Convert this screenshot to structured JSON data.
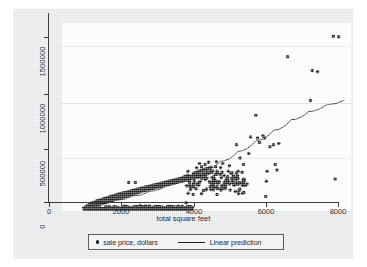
{
  "chart_data": {
    "type": "scatter",
    "title": "",
    "xlabel": "total square feet",
    "ylabel": "",
    "xlim": [
      0,
      8200
    ],
    "ylim": [
      0,
      1700000
    ],
    "xticks": [
      0,
      2000,
      4000,
      6000,
      8000
    ],
    "xtick_labels": [
      "0",
      "2000",
      "4000",
      "6000",
      "8000"
    ],
    "yticks": [
      0,
      500000,
      1000000,
      1500000
    ],
    "ytick_labels": [
      "0",
      "500000",
      "1000000",
      "1500000"
    ],
    "grid": "horizontal",
    "legend_position": "bottom",
    "legend": [
      {
        "label": "sale price, dollars",
        "marker": "dot",
        "color": "#1a1c1e"
      },
      {
        "label": "Linear prediction",
        "marker": "line",
        "color": "#1a1c1e"
      }
    ],
    "series": [
      {
        "name": "sale price, dollars",
        "type": "scatter",
        "marker": "filled-circle",
        "color": "#1a1c1e",
        "n_points_approx": 900,
        "note": "Dense cluster from ~550 to ~3500 sqft rising from ~20000 to ~250000 dollars; fan-out and sparse high-value outliers above 5000 sqft.",
        "points": [
          [
            620,
            30000
          ],
          [
            660,
            25000
          ],
          [
            690,
            40000
          ],
          [
            700,
            22000
          ],
          [
            720,
            48000
          ],
          [
            740,
            35000
          ],
          [
            760,
            55000
          ],
          [
            780,
            30000
          ],
          [
            800,
            60000
          ],
          [
            810,
            42000
          ],
          [
            830,
            70000
          ],
          [
            850,
            38000
          ],
          [
            860,
            52000
          ],
          [
            880,
            75000
          ],
          [
            900,
            45000
          ],
          [
            910,
            62000
          ],
          [
            930,
            80000
          ],
          [
            950,
            50000
          ],
          [
            960,
            68000
          ],
          [
            980,
            90000
          ],
          [
            1000,
            55000
          ],
          [
            1010,
            72000
          ],
          [
            1030,
            95000
          ],
          [
            1050,
            60000
          ],
          [
            1060,
            78000
          ],
          [
            1080,
            100000
          ],
          [
            1100,
            65000
          ],
          [
            1110,
            85000
          ],
          [
            1130,
            105000
          ],
          [
            1150,
            70000
          ],
          [
            1160,
            88000
          ],
          [
            1180,
            110000
          ],
          [
            1200,
            75000
          ],
          [
            1210,
            92000
          ],
          [
            1230,
            115000
          ],
          [
            1250,
            80000
          ],
          [
            1260,
            98000
          ],
          [
            1280,
            120000
          ],
          [
            1300,
            85000
          ],
          [
            1310,
            102000
          ],
          [
            1330,
            125000
          ],
          [
            1350,
            90000
          ],
          [
            1360,
            108000
          ],
          [
            1380,
            130000
          ],
          [
            1400,
            95000
          ],
          [
            1410,
            112000
          ],
          [
            1430,
            135000
          ],
          [
            1450,
            100000
          ],
          [
            1460,
            118000
          ],
          [
            1480,
            140000
          ],
          [
            1500,
            105000
          ],
          [
            1510,
            122000
          ],
          [
            1530,
            145000
          ],
          [
            1550,
            110000
          ],
          [
            1560,
            128000
          ],
          [
            1580,
            150000
          ],
          [
            1600,
            112000
          ],
          [
            1610,
            132000
          ],
          [
            1630,
            155000
          ],
          [
            1650,
            118000
          ],
          [
            1660,
            138000
          ],
          [
            1680,
            158000
          ],
          [
            1700,
            122000
          ],
          [
            1710,
            142000
          ],
          [
            1730,
            162000
          ],
          [
            1750,
            128000
          ],
          [
            1760,
            148000
          ],
          [
            1780,
            165000
          ],
          [
            1800,
            132000
          ],
          [
            1810,
            152000
          ],
          [
            1830,
            170000
          ],
          [
            1850,
            138000
          ],
          [
            1860,
            158000
          ],
          [
            1880,
            175000
          ],
          [
            1900,
            142000
          ],
          [
            1910,
            162000
          ],
          [
            1930,
            178000
          ],
          [
            1950,
            148000
          ],
          [
            1960,
            168000
          ],
          [
            1980,
            182000
          ],
          [
            1890,
            258000
          ],
          [
            2080,
            258000
          ],
          [
            2000,
            152000
          ],
          [
            2010,
            172000
          ],
          [
            2030,
            188000
          ],
          [
            2050,
            158000
          ],
          [
            2060,
            178000
          ],
          [
            2080,
            192000
          ],
          [
            2100,
            162000
          ],
          [
            2110,
            182000
          ],
          [
            2130,
            196000
          ],
          [
            2150,
            168000
          ],
          [
            2160,
            186000
          ],
          [
            2180,
            200000
          ],
          [
            2200,
            172000
          ],
          [
            2210,
            190000
          ],
          [
            2230,
            205000
          ],
          [
            2250,
            178000
          ],
          [
            2260,
            196000
          ],
          [
            2280,
            208000
          ],
          [
            2300,
            182000
          ],
          [
            2310,
            200000
          ],
          [
            2330,
            212000
          ],
          [
            2350,
            186000
          ],
          [
            2360,
            204000
          ],
          [
            2380,
            216000
          ],
          [
            2400,
            190000
          ],
          [
            2410,
            208000
          ],
          [
            2430,
            220000
          ],
          [
            2450,
            195000
          ],
          [
            2460,
            212000
          ],
          [
            2480,
            224000
          ],
          [
            2500,
            198000
          ],
          [
            2510,
            216000
          ],
          [
            2530,
            228000
          ],
          [
            2550,
            202000
          ],
          [
            2560,
            220000
          ],
          [
            2580,
            232000
          ],
          [
            2600,
            206000
          ],
          [
            2610,
            224000
          ],
          [
            2630,
            236000
          ],
          [
            2650,
            210000
          ],
          [
            2660,
            228000
          ],
          [
            2680,
            240000
          ],
          [
            2700,
            214000
          ],
          [
            2710,
            232000
          ],
          [
            2730,
            244000
          ],
          [
            2750,
            218000
          ],
          [
            2760,
            236000
          ],
          [
            2780,
            248000
          ],
          [
            2800,
            222000
          ],
          [
            2810,
            240000
          ],
          [
            2830,
            252000
          ],
          [
            2850,
            226000
          ],
          [
            2860,
            244000
          ],
          [
            2880,
            256000
          ],
          [
            2900,
            230000
          ],
          [
            2910,
            248000
          ],
          [
            2930,
            260000
          ],
          [
            2950,
            234000
          ],
          [
            2960,
            252000
          ],
          [
            2980,
            264000
          ],
          [
            3000,
            238000
          ],
          [
            3010,
            256000
          ],
          [
            3030,
            268000
          ],
          [
            3050,
            242000
          ],
          [
            3060,
            260000
          ],
          [
            3080,
            272000
          ],
          [
            3100,
            246000
          ],
          [
            3110,
            264000
          ],
          [
            3130,
            276000
          ],
          [
            3150,
            250000
          ],
          [
            3160,
            268000
          ],
          [
            3180,
            280000
          ],
          [
            3200,
            254000
          ],
          [
            3210,
            272000
          ],
          [
            3230,
            284000
          ],
          [
            3250,
            258000
          ],
          [
            3260,
            276000
          ],
          [
            3280,
            288000
          ],
          [
            3300,
            262000
          ],
          [
            3310,
            280000
          ],
          [
            3330,
            292000
          ],
          [
            3350,
            266000
          ],
          [
            3360,
            284000
          ],
          [
            3380,
            296000
          ],
          [
            3400,
            270000
          ],
          [
            3410,
            288000
          ],
          [
            3430,
            300000
          ],
          [
            3450,
            274000
          ],
          [
            3460,
            292000
          ],
          [
            3480,
            304000
          ],
          [
            3500,
            278000
          ],
          [
            3510,
            296000
          ],
          [
            3530,
            308000
          ],
          [
            3550,
            282000
          ],
          [
            3560,
            300000
          ],
          [
            3580,
            312000
          ],
          [
            3600,
            286000
          ],
          [
            3610,
            304000
          ],
          [
            3630,
            316000
          ],
          [
            3650,
            290000
          ],
          [
            3520,
            75000
          ],
          [
            3580,
            160000
          ],
          [
            3720,
            150000
          ],
          [
            3700,
            300000
          ],
          [
            3710,
            320000
          ],
          [
            3730,
            340000
          ],
          [
            3750,
            295000
          ],
          [
            3760,
            315000
          ],
          [
            3780,
            345000
          ],
          [
            3800,
            305000
          ],
          [
            3810,
            325000
          ],
          [
            3830,
            350000
          ],
          [
            3850,
            310000
          ],
          [
            3860,
            330000
          ],
          [
            3880,
            360000
          ],
          [
            3900,
            315000
          ],
          [
            3910,
            335000
          ],
          [
            3930,
            365000
          ],
          [
            3950,
            320000
          ],
          [
            3960,
            400000
          ],
          [
            3980,
            370000
          ],
          [
            3900,
            430000
          ],
          [
            3820,
            390000
          ],
          [
            4000,
            325000
          ],
          [
            4010,
            345000
          ],
          [
            4030,
            375000
          ],
          [
            4050,
            330000
          ],
          [
            4060,
            420000
          ],
          [
            4080,
            380000
          ],
          [
            4100,
            335000
          ],
          [
            4110,
            355000
          ],
          [
            4130,
            385000
          ],
          [
            4150,
            340000
          ],
          [
            4160,
            440000
          ],
          [
            4180,
            390000
          ],
          [
            4200,
            345000
          ],
          [
            4210,
            365000
          ],
          [
            4230,
            395000
          ],
          [
            4250,
            350000
          ],
          [
            4260,
            300000
          ],
          [
            4280,
            260000
          ],
          [
            4300,
            270000
          ],
          [
            4310,
            250000
          ],
          [
            4330,
            285000
          ],
          [
            4350,
            330000
          ],
          [
            4360,
            400000
          ],
          [
            4380,
            445000
          ],
          [
            4400,
            360000
          ],
          [
            4100,
            200000
          ],
          [
            4220,
            195000
          ],
          [
            4300,
            215000
          ],
          [
            4420,
            250000
          ],
          [
            4450,
            255000
          ],
          [
            4500,
            390000
          ],
          [
            4520,
            300000
          ],
          [
            4540,
            350000
          ],
          [
            4560,
            430000
          ],
          [
            4600,
            320000
          ],
          [
            4650,
            250000
          ],
          [
            4700,
            290000
          ],
          [
            4720,
            360000
          ],
          [
            4750,
            410000
          ],
          [
            4800,
            340000
          ],
          [
            4850,
            255000
          ],
          [
            4900,
            300000
          ],
          [
            4950,
            600000
          ],
          [
            4980,
            245000
          ],
          [
            5000,
            360000
          ],
          [
            5050,
            480000
          ],
          [
            5100,
            250000
          ],
          [
            5150,
            420000
          ],
          [
            5200,
            230000
          ],
          [
            5250,
            245000
          ],
          [
            5300,
            520000
          ],
          [
            5350,
            670000
          ],
          [
            5500,
            865000
          ],
          [
            5550,
            660000
          ],
          [
            5600,
            620000
          ],
          [
            5700,
            680000
          ],
          [
            5750,
            660000
          ],
          [
            5780,
            130000
          ],
          [
            5800,
            270000
          ],
          [
            5820,
            360000
          ],
          [
            5900,
            580000
          ],
          [
            6000,
            600000
          ],
          [
            6050,
            420000
          ],
          [
            6100,
            370000
          ],
          [
            6150,
            610000
          ],
          [
            6400,
            1395000
          ],
          [
            7050,
            1000000
          ],
          [
            7100,
            1270000
          ],
          [
            7250,
            1260000
          ],
          [
            7700,
            1580000
          ],
          [
            7850,
            1575000
          ],
          [
            7750,
            290000
          ]
        ]
      },
      {
        "name": "Linear prediction",
        "type": "line",
        "color": "#1a1c1e",
        "note": "Slightly convex (quadratic) fitted curve rising from the dense cluster to about 1,000,000 dollars at 8000 sqft.",
        "points": [
          [
            700,
            40000
          ],
          [
            1500,
            95000
          ],
          [
            2000,
            135000
          ],
          [
            2500,
            180000
          ],
          [
            3000,
            235000
          ],
          [
            3500,
            295000
          ],
          [
            4000,
            370000
          ],
          [
            4500,
            450000
          ],
          [
            5000,
            540000
          ],
          [
            5500,
            635000
          ],
          [
            6000,
            730000
          ],
          [
            6500,
            825000
          ],
          [
            7000,
            900000
          ],
          [
            7500,
            960000
          ],
          [
            8000,
            1000000
          ]
        ]
      }
    ]
  }
}
